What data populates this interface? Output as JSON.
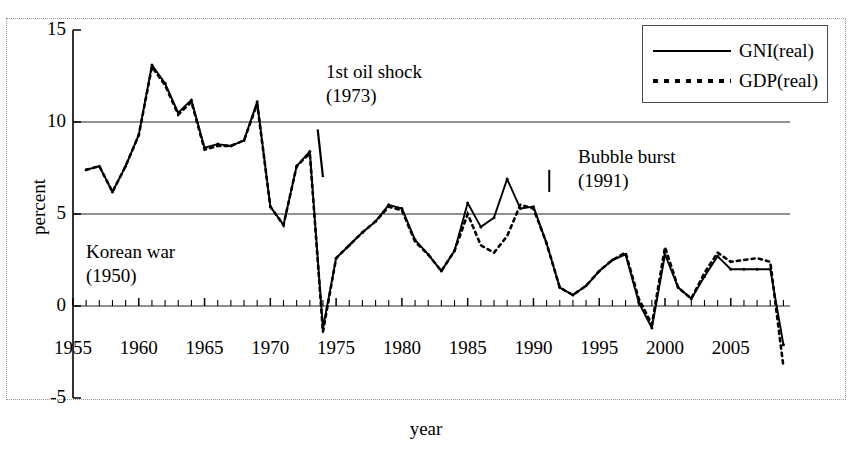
{
  "chart_data": {
    "type": "line",
    "title": "",
    "xlabel": "year",
    "ylabel": "percent",
    "xlim": [
      1955,
      2009.5
    ],
    "ylim": [
      -5,
      15
    ],
    "xticks": [
      1955,
      1960,
      1965,
      1970,
      1975,
      1980,
      1985,
      1990,
      1995,
      2000,
      2005
    ],
    "xtick_labels": [
      "1955",
      "1960",
      "1965",
      "1970",
      "1975",
      "1980",
      "1985",
      "1990",
      "1995",
      "2000",
      "2005"
    ],
    "yticks": [
      -5,
      0,
      5,
      10,
      15
    ],
    "ytick_labels": [
      "-5",
      "0",
      "5",
      "10",
      "15"
    ],
    "minor_xtick_interval": 1,
    "grid": "horizontal gridlines at y = 0, 5, 10",
    "legend_position": "top-right",
    "x": [
      1956,
      1957,
      1958,
      1959,
      1960,
      1961,
      1962,
      1963,
      1964,
      1965,
      1966,
      1967,
      1968,
      1969,
      1970,
      1971,
      1972,
      1973,
      1974,
      1975,
      1976,
      1977,
      1978,
      1979,
      1980,
      1981,
      1982,
      1983,
      1984,
      1985,
      1986,
      1987,
      1988,
      1989,
      1990,
      1991,
      1992,
      1993,
      1994,
      1995,
      1996,
      1997,
      1998,
      1999,
      2000,
      2001,
      2002,
      2003,
      2004,
      2005,
      2006,
      2007,
      2008,
      2009
    ],
    "series": [
      {
        "name": "GNI(real)",
        "style": "solid",
        "marker": "small-dot",
        "values": [
          7.4,
          7.6,
          6.2,
          7.6,
          9.3,
          13.1,
          12.1,
          10.5,
          11.2,
          8.6,
          8.8,
          8.7,
          9.0,
          11.1,
          5.4,
          4.4,
          7.6,
          8.4,
          -1.2,
          2.6,
          3.3,
          4.0,
          4.6,
          5.5,
          5.3,
          3.6,
          2.8,
          1.9,
          3.0,
          5.6,
          4.3,
          4.8,
          6.9,
          5.3,
          5.4,
          3.4,
          1.0,
          0.6,
          1.1,
          1.9,
          2.5,
          2.8,
          0.2,
          -1.2,
          2.8,
          1.0,
          0.4,
          1.6,
          2.7,
          2.0,
          2.0,
          2.0,
          2.0,
          -2.1
        ]
      },
      {
        "name": "GDP(real)",
        "style": "dotted",
        "marker": "small-dot",
        "values": [
          7.4,
          7.6,
          6.2,
          7.6,
          9.3,
          13.0,
          12.0,
          10.4,
          11.1,
          8.5,
          8.7,
          8.7,
          9.0,
          11.0,
          5.4,
          4.4,
          7.6,
          8.3,
          -1.4,
          2.6,
          3.3,
          4.0,
          4.6,
          5.4,
          5.2,
          3.5,
          2.8,
          1.9,
          3.0,
          5.0,
          3.3,
          2.9,
          3.8,
          5.5,
          5.3,
          3.4,
          1.0,
          0.6,
          1.1,
          1.9,
          2.5,
          2.9,
          0.4,
          -1.0,
          3.2,
          1.0,
          0.4,
          1.8,
          2.9,
          2.4,
          2.5,
          2.6,
          2.4,
          -3.3
        ]
      }
    ],
    "annotations": [
      {
        "id": "oil",
        "label": "1st oil shock",
        "year_label": "(1973)",
        "points_to_year": 1974
      },
      {
        "id": "korea",
        "label": "Korean war",
        "year_label": "(1950)",
        "points_to_year": 1950
      },
      {
        "id": "bubble",
        "label": "Bubble burst",
        "year_label": "(1991)",
        "points_to_year": 1991
      }
    ],
    "colors": {
      "line": "#000000",
      "gridline": "#6b6b6b",
      "axis": "#000000",
      "frame": "#9a9a9a",
      "background": "#ffffff"
    }
  },
  "legend": {
    "entries": [
      {
        "label": "GNI(real)",
        "style": "solid"
      },
      {
        "label": "GDP(real)",
        "style": "dotted"
      }
    ]
  }
}
